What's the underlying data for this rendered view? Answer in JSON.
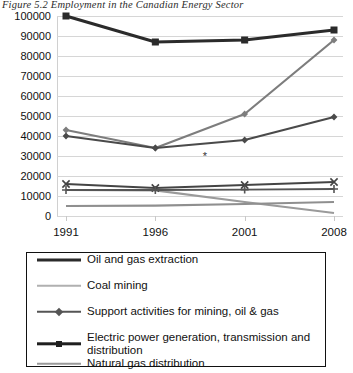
{
  "figure": {
    "title": "Figure 5.2 Employment in the Canadian Energy Sector",
    "footnote_marker": "*"
  },
  "chart_data": {
    "type": "line",
    "title": "Figure 5.2 Employment in the Canadian Energy Sector",
    "xlabel": "",
    "ylabel": "",
    "categories": [
      "1991",
      "1996",
      "2001",
      "2008"
    ],
    "x": [
      1991,
      1996,
      2001,
      2008
    ],
    "ylim": [
      0,
      100000
    ],
    "yticks": [
      0,
      10000,
      20000,
      30000,
      40000,
      50000,
      60000,
      70000,
      80000,
      90000,
      100000
    ],
    "ytick_labels": [
      "0",
      "10000",
      "20000",
      "30000",
      "40000",
      "50000",
      "60000",
      "70000",
      "80000",
      "90000",
      "100000"
    ],
    "grid": true,
    "legend_position": "below",
    "series": [
      {
        "name": "Oil and gas extraction",
        "values": [
          43000,
          34000,
          51000,
          88000
        ],
        "color": "#7d7d7d",
        "marker": "diamond",
        "width": 2.2
      },
      {
        "name": "Coal mining",
        "values": [
          13000,
          12800,
          7000,
          1500
        ],
        "color": "#9a9a9a",
        "marker": "none",
        "width": 2.2
      },
      {
        "name": "Support activities for mining, oil & gas",
        "values": [
          40000,
          34000,
          38000,
          49500
        ],
        "color": "#4a4a4a",
        "marker": "diamond",
        "width": 2.2
      },
      {
        "name": "Electric power generation, transmission and distribution",
        "values": [
          100000,
          87000,
          88000,
          93000
        ],
        "color": "#2b2b2b",
        "marker": "square",
        "width": 3.0
      },
      {
        "name": "Natural gas distribution",
        "values": [
          5000,
          5200,
          6000,
          7000
        ],
        "color": "#8f8f8f",
        "marker": "none",
        "width": 2.2
      },
      {
        "name": "series-x-marker",
        "values": [
          16000,
          14000,
          15500,
          17000
        ],
        "color": "#444444",
        "marker": "x",
        "width": 1.8
      },
      {
        "name": "series-plus-marker",
        "values": [
          13000,
          13000,
          13200,
          13500
        ],
        "color": "#555555",
        "marker": "plus",
        "width": 1.8
      }
    ]
  },
  "legend": {
    "entries": [
      {
        "label": "Oil and gas extraction",
        "color": "#2b2b2b",
        "marker": "none",
        "width": 3
      },
      {
        "label": "Coal mining",
        "color": "#b0b0b0",
        "marker": "none",
        "width": 2.5
      },
      {
        "label": "Support activities for mining, oil & gas",
        "color": "#555555",
        "marker": "diamond",
        "width": 2.5
      },
      {
        "label": "Electric power generation, transmission and\ndistribution",
        "color": "#1f1f1f",
        "marker": "square",
        "width": 3.4
      },
      {
        "label": "Natural gas distribution",
        "color": "#9a9a9a",
        "marker": "none",
        "width": 2.5
      }
    ]
  }
}
